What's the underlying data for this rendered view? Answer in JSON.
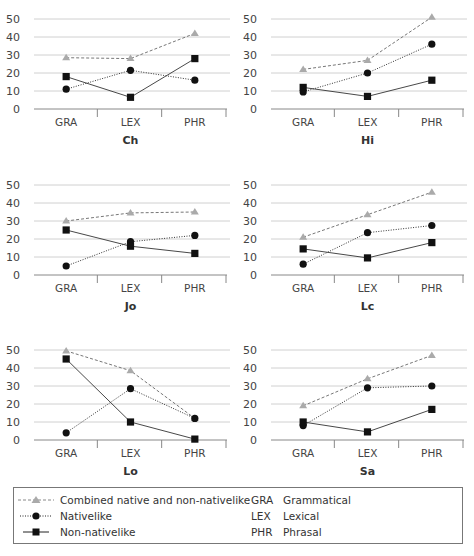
{
  "chart_data": [
    {
      "type": "line",
      "title": "Ch",
      "categories": [
        "GRA",
        "LEX",
        "PHR"
      ],
      "ylim": [
        0,
        50
      ],
      "yticks": [
        0,
        10,
        20,
        30,
        40,
        50
      ],
      "grid": true,
      "series": [
        {
          "name": "Combined native and non-nativelike",
          "values": [
            28.5,
            28,
            42
          ]
        },
        {
          "name": "Nativelike",
          "values": [
            11,
            21.5,
            16
          ]
        },
        {
          "name": "Non-nativelike",
          "values": [
            18,
            6.5,
            28
          ]
        }
      ]
    },
    {
      "type": "line",
      "title": "Hi",
      "categories": [
        "GRA",
        "LEX",
        "PHR"
      ],
      "ylim": [
        0,
        50
      ],
      "yticks": [
        0,
        10,
        20,
        30,
        40,
        50
      ],
      "grid": true,
      "series": [
        {
          "name": "Combined native and non-nativelike",
          "values": [
            22,
            27,
            51
          ]
        },
        {
          "name": "Nativelike",
          "values": [
            9.5,
            20,
            36
          ]
        },
        {
          "name": "Non-nativelike",
          "values": [
            12,
            7,
            16
          ]
        }
      ]
    },
    {
      "type": "line",
      "title": "Jo",
      "categories": [
        "GRA",
        "LEX",
        "PHR"
      ],
      "ylim": [
        0,
        50
      ],
      "yticks": [
        0,
        10,
        20,
        30,
        40,
        50
      ],
      "grid": true,
      "series": [
        {
          "name": "Combined native and non-nativelike",
          "values": [
            30,
            34.5,
            35
          ]
        },
        {
          "name": "Nativelike",
          "values": [
            5,
            18.5,
            22
          ]
        },
        {
          "name": "Non-nativelike",
          "values": [
            25,
            16,
            12
          ]
        }
      ]
    },
    {
      "type": "line",
      "title": "Lc",
      "categories": [
        "GRA",
        "LEX",
        "PHR"
      ],
      "ylim": [
        0,
        50
      ],
      "yticks": [
        0,
        10,
        20,
        30,
        40,
        50
      ],
      "grid": true,
      "series": [
        {
          "name": "Combined native and non-nativelike",
          "values": [
            21,
            33.5,
            46
          ]
        },
        {
          "name": "Nativelike",
          "values": [
            6,
            23.5,
            27.5
          ]
        },
        {
          "name": "Non-nativelike",
          "values": [
            14.5,
            9.5,
            18
          ]
        }
      ]
    },
    {
      "type": "line",
      "title": "Lo",
      "categories": [
        "GRA",
        "LEX",
        "PHR"
      ],
      "ylim": [
        0,
        50
      ],
      "yticks": [
        0,
        10,
        20,
        30,
        40,
        50
      ],
      "grid": true,
      "series": [
        {
          "name": "Combined native and non-nativelike",
          "values": [
            49.5,
            38.5,
            12
          ]
        },
        {
          "name": "Nativelike",
          "values": [
            4,
            28.5,
            12
          ]
        },
        {
          "name": "Non-nativelike",
          "values": [
            45,
            10,
            0.5
          ]
        }
      ]
    },
    {
      "type": "line",
      "title": "Sa",
      "categories": [
        "GRA",
        "LEX",
        "PHR"
      ],
      "ylim": [
        0,
        50
      ],
      "yticks": [
        0,
        10,
        20,
        30,
        40,
        50
      ],
      "grid": true,
      "series": [
        {
          "name": "Combined native and non-nativelike",
          "values": [
            19,
            34,
            47
          ]
        },
        {
          "name": "Nativelike",
          "values": [
            8,
            29,
            30
          ]
        },
        {
          "name": "Non-nativelike",
          "values": [
            10,
            4.5,
            17
          ]
        }
      ]
    }
  ],
  "legend": {
    "series": [
      {
        "label": "Combined native and non-nativelike",
        "marker": "triangle",
        "line": "dashed",
        "color": "#999999"
      },
      {
        "label": "Nativelike",
        "marker": "circle",
        "line": "dotted",
        "color": "#111111"
      },
      {
        "label": "Non-nativelike",
        "marker": "square",
        "line": "solid",
        "color": "#111111"
      }
    ],
    "abbreviations": [
      {
        "abbr": "GRA",
        "full": "Grammatical"
      },
      {
        "abbr": "LEX",
        "full": "Lexical"
      },
      {
        "abbr": "PHR",
        "full": "Phrasal"
      }
    ]
  },
  "colors": {
    "grid": "#d0d0d0",
    "axis": "#888888",
    "combined": "#999999",
    "nativelike": "#111111",
    "nonnativelike": "#111111"
  }
}
